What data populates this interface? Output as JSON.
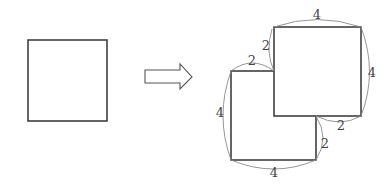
{
  "diagram": {
    "colors": {
      "stroke": "#333333",
      "arrow_stroke": "#555555",
      "dimension_line": "#8a8a8a",
      "label": "#444444"
    },
    "original_square": {
      "label": "original-square"
    },
    "arrow": {
      "label": "transform-arrow",
      "direction": "right"
    },
    "result_figure": {
      "labels": {
        "top": "4",
        "right": "4",
        "upper_step_vertical": "2",
        "upper_step_horizontal": "2",
        "left": "4",
        "lower_step_horizontal": "2",
        "lower_step_vertical": "2",
        "bottom": "4"
      }
    }
  }
}
